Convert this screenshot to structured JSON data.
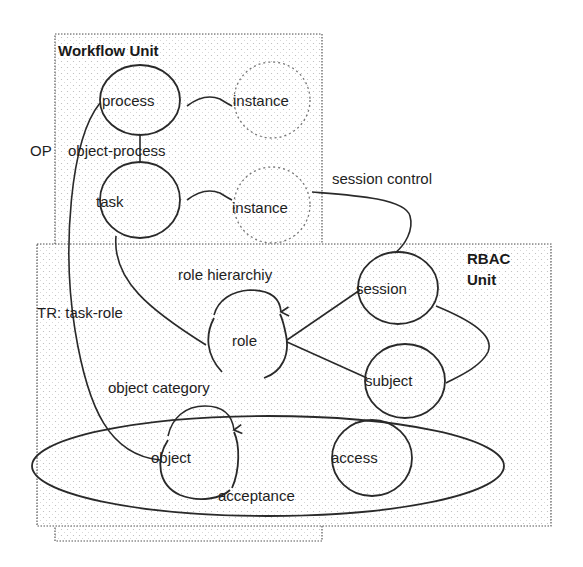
{
  "diagram": {
    "units": {
      "workflow": {
        "title": "Workflow Unit"
      },
      "rbac": {
        "title_line1": "RBAC",
        "title_line2": "Unit"
      }
    },
    "nodes": {
      "process": "process",
      "process_instance": "instance",
      "task": "task",
      "task_instance": "instance",
      "session": "session",
      "role": "role",
      "subject": "subject",
      "object": "object",
      "access": "access"
    },
    "edge_labels": {
      "op_prefix": "OP",
      "object_process": "object-process",
      "session_control": "session control",
      "role_hierarchy": "role hierarchiy",
      "task_role": "TR: task-role",
      "object_category": "object category",
      "acceptance": "acceptance"
    },
    "colors": {
      "stroke": "#2a2a2a",
      "box_border": "#555555",
      "dashed_node": "#777777",
      "text": "#1e1e1e"
    }
  }
}
